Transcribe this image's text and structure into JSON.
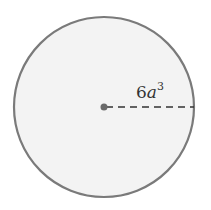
{
  "diagram": {
    "shape": "circle",
    "radius_label": {
      "coefficient": "6",
      "variable": "a",
      "exponent": "3"
    },
    "colors": {
      "stroke": "#7a7a7a",
      "fill": "#f3f3f3",
      "center_dot": "#6a6a6a",
      "dash": "#333333"
    }
  }
}
